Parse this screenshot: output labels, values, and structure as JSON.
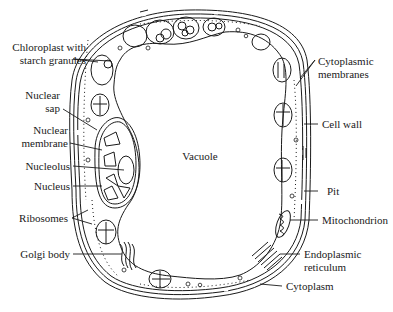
{
  "diagram": {
    "colors": {
      "ink": "#1a1a1a",
      "background": "#ffffff"
    },
    "labels": {
      "chloroplast": "Chloroplast with\nstarch granules",
      "chloroplast_line1": "Chloroplast with",
      "chloroplast_line2": "starch granules",
      "nuclear_sap_line1": "Nuclear",
      "nuclear_sap_line2": "sap",
      "nuclear_membrane_line1": "Nuclear",
      "nuclear_membrane_line2": "membrane",
      "nucleolus": "Nucleolus",
      "nucleus": "Nucleus",
      "ribosomes": "Ribosomes",
      "golgi_body": "Golgi body",
      "vacuole": "Vacuole",
      "cytoplasmic_membranes_line1": "Cytoplasmic",
      "cytoplasmic_membranes_line2": "membranes",
      "cell_wall": "Cell wall",
      "pit": "Pit",
      "mitochondrion": "Mitochondrion",
      "endoplasmic_reticulum_line1": "Endoplasmic",
      "endoplasmic_reticulum_line2": "reticulum",
      "cytoplasm": "Cytoplasm"
    }
  }
}
